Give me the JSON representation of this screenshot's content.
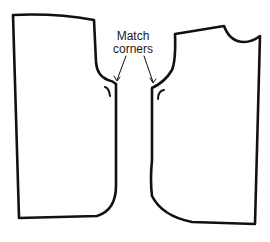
{
  "diagram": {
    "title": "",
    "annotation": {
      "line1": "Match",
      "line2": "corners"
    },
    "pieces": [
      {
        "name": "left-pattern-piece",
        "description": "back bodice piece with armhole curve"
      },
      {
        "name": "right-pattern-piece",
        "description": "front bodice piece with neckline and armhole curve"
      }
    ],
    "colors": {
      "stroke": "#111111",
      "background": "#ffffff",
      "text": "#1a1a1a"
    }
  }
}
